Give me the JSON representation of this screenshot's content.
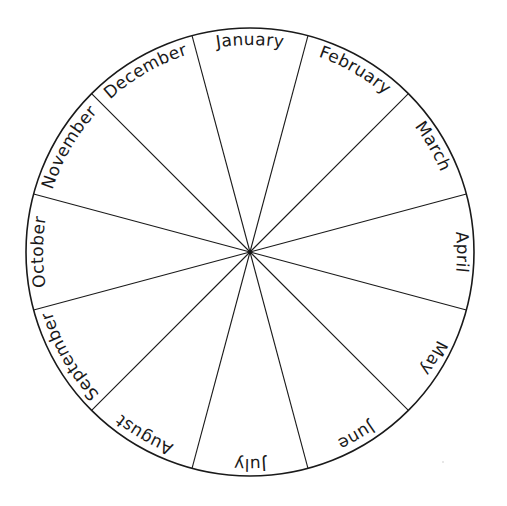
{
  "diagram": {
    "type": "month-wheel",
    "title": "",
    "center": {
      "x": 250,
      "y": 252
    },
    "radius": 224,
    "segments": 12,
    "colors": {
      "line": "#1a1a1a",
      "background": "#ffffff"
    },
    "months": [
      {
        "label": "January"
      },
      {
        "label": "February"
      },
      {
        "label": "March"
      },
      {
        "label": "April"
      },
      {
        "label": "May"
      },
      {
        "label": "June"
      },
      {
        "label": "July"
      },
      {
        "label": "August"
      },
      {
        "label": "September"
      },
      {
        "label": "October"
      },
      {
        "label": "November"
      },
      {
        "label": "December"
      }
    ]
  }
}
